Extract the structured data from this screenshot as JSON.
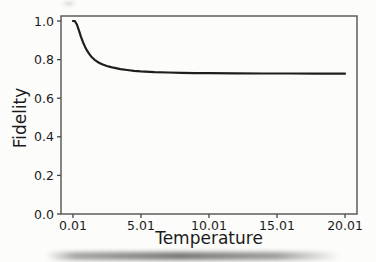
{
  "chart_data": {
    "type": "line",
    "title": "",
    "xlabel": "Temperature",
    "ylabel": "Fidelity",
    "xlim": [
      -0.87,
      20.89
    ],
    "ylim": [
      0,
      1.026
    ],
    "grid": false,
    "legend": "none",
    "x_ticks": {
      "values": [
        0.01,
        5.01,
        10.01,
        15.01,
        20.01
      ],
      "labels": [
        "0.01",
        "5.01",
        "10.01",
        "15.01",
        "20.01"
      ]
    },
    "y_ticks": {
      "values": [
        0.0,
        0.2,
        0.4,
        0.6,
        0.8,
        1.0
      ],
      "labels": [
        "0.0",
        "0.2",
        "0.4",
        "0.6",
        "0.8",
        "1.0"
      ]
    },
    "series": [
      {
        "name": "fidelity-vs-temperature",
        "color": "#1e1e1e",
        "x": [
          0.01,
          0.15,
          0.3,
          0.45,
          0.6,
          0.75,
          0.9,
          1.05,
          1.2,
          1.4,
          1.6,
          1.8,
          2.0,
          2.25,
          2.5,
          2.75,
          3.0,
          3.5,
          4.0,
          4.5,
          5.0,
          6.0,
          7.0,
          8.0,
          9.0,
          10.0,
          12.0,
          14.0,
          16.0,
          18.0,
          20.01
        ],
        "y": [
          1.0,
          0.999,
          0.982,
          0.95,
          0.918,
          0.89,
          0.866,
          0.846,
          0.83,
          0.812,
          0.799,
          0.789,
          0.781,
          0.773,
          0.767,
          0.762,
          0.758,
          0.751,
          0.746,
          0.742,
          0.739,
          0.735,
          0.733,
          0.731,
          0.73,
          0.73,
          0.729,
          0.728,
          0.728,
          0.727,
          0.727
        ]
      }
    ]
  },
  "style": {
    "background": "#fcfcfa",
    "spine_color": "#5d5d5d",
    "tick_color": "#454545",
    "text_color": "#1b1b1b",
    "curve_color": "#1e1e1e"
  }
}
